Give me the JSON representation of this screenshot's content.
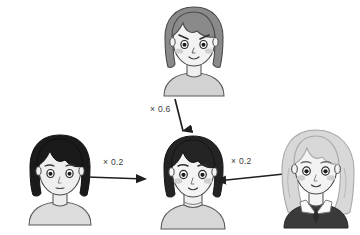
{
  "diagram": {
    "type": "face-blending-weight-diagram",
    "background_color": "#ffffff",
    "nodes": [
      {
        "id": "top-source",
        "role": "source",
        "position": "top-center",
        "description": "woman with medium-gray bob hair, angled eyebrows, blush cheeks, light gray shirt",
        "hair_color": "#8a8a8a",
        "skin_color": "#f2f2f2",
        "shirt_color": "#d2d2d2"
      },
      {
        "id": "left-source",
        "role": "source",
        "position": "left",
        "description": "person with black short hair, neutral mouth, light gray shirt",
        "hair_color": "#1a1a1a",
        "skin_color": "#efefef",
        "shirt_color": "#dcdcdc"
      },
      {
        "id": "center-result",
        "role": "result",
        "position": "center",
        "description": "blended face with dark hair, blush cheeks, turtleneck collar, light gray shirt",
        "hair_color": "#242424",
        "skin_color": "#f4f4f4",
        "shirt_color": "#d7d7d7"
      },
      {
        "id": "right-source",
        "role": "source",
        "position": "right",
        "description": "person with light gray wavy long hair, dark suit jacket with white collar and dark tie",
        "hair_color": "#d8d8d8",
        "skin_color": "#f3f3f3",
        "shirt_color": "#3a3a3a"
      }
    ],
    "edges": [
      {
        "id": "edge-top",
        "from": "top-source",
        "to": "center-result",
        "label": "× 0.6",
        "weight": 0.6,
        "direction": "down"
      },
      {
        "id": "edge-left",
        "from": "left-source",
        "to": "center-result",
        "label": "× 0.2",
        "weight": 0.2,
        "direction": "right"
      },
      {
        "id": "edge-right",
        "from": "right-source",
        "to": "center-result",
        "label": "× 0.2",
        "weight": 0.2,
        "direction": "left"
      }
    ],
    "labels": {
      "top_weight": "× 0.6",
      "left_weight": "× 0.2",
      "right_weight": "× 0.2"
    },
    "colors": {
      "arrow": "#1f1f1f",
      "outline": "#3a3a3a",
      "text": "#3b3b3b",
      "blush": "#cfcfcf"
    }
  }
}
